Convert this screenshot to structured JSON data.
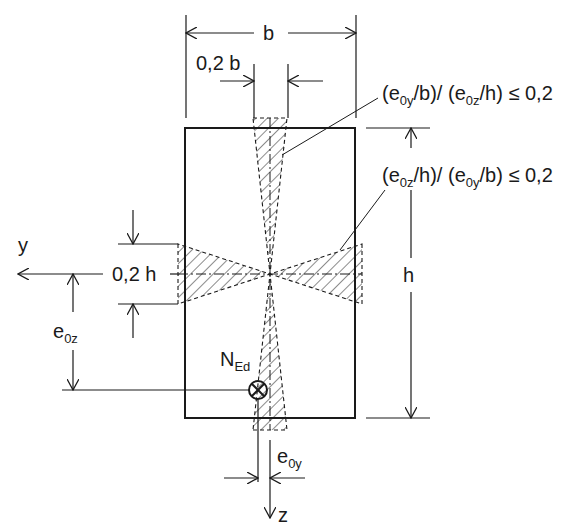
{
  "diagram": {
    "labels": {
      "b": "b",
      "h": "h",
      "y_axis": "y",
      "z_axis": "z",
      "b_fraction": "0,2 b",
      "h_fraction": "0,2 h",
      "e0z_main": "e",
      "e0z_sub": "0z",
      "e0y_main": "e",
      "e0y_sub": "0y",
      "ned_main": "N",
      "ned_sub": "Ed"
    },
    "conditions": [
      {
        "text_parts": [
          "(e",
          "0y",
          "/b)/ (e",
          "0z",
          "/h) ≤ 0,2"
        ]
      },
      {
        "text_parts": [
          "(e",
          "0z",
          "/h)/ (e",
          "0y",
          "/b) ≤ 0,2"
        ]
      }
    ],
    "colors": {
      "line": "#1a1a1a",
      "background": "#ffffff"
    }
  }
}
